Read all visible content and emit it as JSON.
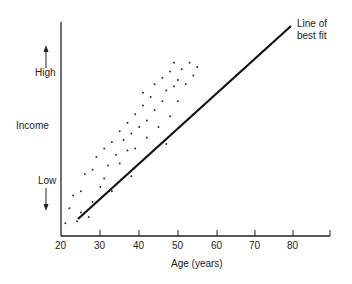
{
  "chart_data": {
    "type": "scatter",
    "title": "",
    "xlabel": "Age (years)",
    "ylabel": "Income",
    "y_high_label": "High",
    "y_low_label": "Low",
    "x_ticks": [
      20,
      30,
      40,
      50,
      60,
      70,
      80
    ],
    "xlim": [
      20,
      90
    ],
    "annotation": "Line of best fit",
    "line_of_best_fit": {
      "x_start": 24,
      "x_end": 80
    },
    "points_approx": [
      [
        21,
        0.05
      ],
      [
        22,
        0.12
      ],
      [
        23,
        0.18
      ],
      [
        24,
        0.06
      ],
      [
        25,
        0.2
      ],
      [
        25,
        0.1
      ],
      [
        26,
        0.28
      ],
      [
        27,
        0.08
      ],
      [
        28,
        0.15
      ],
      [
        28,
        0.3
      ],
      [
        29,
        0.36
      ],
      [
        30,
        0.22
      ],
      [
        31,
        0.26
      ],
      [
        31,
        0.4
      ],
      [
        32,
        0.32
      ],
      [
        33,
        0.43
      ],
      [
        33,
        0.2
      ],
      [
        34,
        0.37
      ],
      [
        35,
        0.48
      ],
      [
        35,
        0.33
      ],
      [
        36,
        0.44
      ],
      [
        37,
        0.39
      ],
      [
        37,
        0.52
      ],
      [
        38,
        0.27
      ],
      [
        38,
        0.47
      ],
      [
        39,
        0.56
      ],
      [
        39,
        0.4
      ],
      [
        40,
        0.5
      ],
      [
        41,
        0.6
      ],
      [
        41,
        0.66
      ],
      [
        42,
        0.45
      ],
      [
        42,
        0.53
      ],
      [
        43,
        0.64
      ],
      [
        44,
        0.58
      ],
      [
        44,
        0.7
      ],
      [
        45,
        0.5
      ],
      [
        46,
        0.62
      ],
      [
        46,
        0.73
      ],
      [
        47,
        0.42
      ],
      [
        47,
        0.67
      ],
      [
        48,
        0.76
      ],
      [
        48,
        0.55
      ],
      [
        49,
        0.69
      ],
      [
        49,
        0.8
      ],
      [
        50,
        0.72
      ],
      [
        50,
        0.62
      ],
      [
        51,
        0.77
      ],
      [
        52,
        0.7
      ],
      [
        53,
        0.8
      ],
      [
        54,
        0.74
      ],
      [
        55,
        0.78
      ]
    ]
  }
}
